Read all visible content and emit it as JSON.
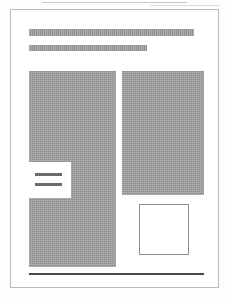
{
  "document": {
    "kind": "scanned-page-thumbnail",
    "page_background_color": "#ffffff",
    "page_border_color": "#b9b9b9",
    "redaction_fill_color": "#9d9d9d",
    "rule_color": "#4a4a4a"
  },
  "artifacts": {
    "top_streak_label": "",
    "top_streak_secondary_label": ""
  },
  "header": {
    "title_line": "",
    "subtitle_line": ""
  },
  "body": {
    "left_column_block_label": "",
    "right_column_block_label": ""
  },
  "callout": {
    "rule_1_label": "",
    "rule_2_label": ""
  },
  "figure": {
    "box_label": ""
  },
  "footer": {
    "rule_label": ""
  }
}
